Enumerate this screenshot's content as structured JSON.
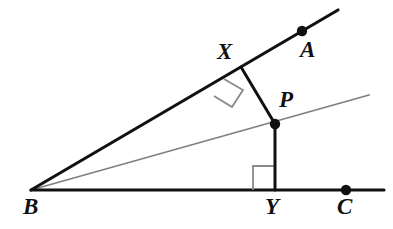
{
  "figure": {
    "type": "geometry-diagram",
    "width": 393,
    "height": 229,
    "background_color": "#ffffff"
  },
  "colors": {
    "stroke_primary": "#111111",
    "stroke_secondary": "#808080",
    "right_angle_mark": "#8a8a8a",
    "label_color": "#111111",
    "background": "#ffffff"
  },
  "labels": {
    "A": "A",
    "B": "B",
    "C": "C",
    "P": "P",
    "X": "X",
    "Y": "Y"
  },
  "points": [
    {
      "name": "B",
      "label": "B",
      "x": 31,
      "y": 190,
      "dot": false,
      "label_x": 23,
      "label_y": 195
    },
    {
      "name": "A",
      "label": "A",
      "x": 302,
      "y": 31,
      "dot": true,
      "label_x": 300,
      "label_y": 38
    },
    {
      "name": "C",
      "label": "C",
      "x": 346,
      "y": 190,
      "dot": true,
      "label_x": 337,
      "label_y": 195
    },
    {
      "name": "X",
      "label": "X",
      "x": 241,
      "y": 67,
      "dot": false,
      "label_x": 217,
      "label_y": 40
    },
    {
      "name": "P",
      "label": "P",
      "x": 275,
      "y": 124,
      "dot": true,
      "label_x": 279,
      "label_y": 88
    },
    {
      "name": "Y",
      "label": "Y",
      "x": 275,
      "y": 190,
      "dot": false,
      "label_x": 265,
      "label_y": 195
    }
  ],
  "segments": [
    {
      "name": "ray-BA",
      "from": "B",
      "to": "A-extended",
      "x1": 31,
      "y1": 190,
      "x2": 338,
      "y2": 10,
      "color": "#111111",
      "width": 3.1
    },
    {
      "name": "ray-BC",
      "from": "B",
      "to": "C-extended",
      "x1": 31,
      "y1": 190,
      "x2": 384,
      "y2": 190,
      "color": "#111111",
      "width": 3.1
    },
    {
      "name": "ray-BP-bisector",
      "from": "B",
      "to": "P-extended",
      "x1": 31,
      "y1": 190,
      "x2": 369,
      "y2": 95,
      "color": "#808080",
      "width": 1.8
    },
    {
      "name": "segment-PX",
      "from": "P",
      "to": "X",
      "x1": 275,
      "y1": 124,
      "x2": 241,
      "y2": 67,
      "color": "#111111",
      "width": 3.0
    },
    {
      "name": "segment-PY",
      "from": "P",
      "to": "Y",
      "x1": 275,
      "y1": 124,
      "x2": 275,
      "y2": 190,
      "color": "#111111",
      "width": 3.0
    }
  ],
  "right_angle_marks": [
    {
      "name": "right-angle-at-X",
      "vertex": "X",
      "points": "224,79 243,90 232,107 214,96",
      "color": "#8a8a8a",
      "width": 1.8
    },
    {
      "name": "right-angle-at-Y",
      "vertex": "Y",
      "points": "253,190 253,166 275,166",
      "color": "#8a8a8a",
      "width": 1.8
    }
  ],
  "dot_radius": 5.2
}
